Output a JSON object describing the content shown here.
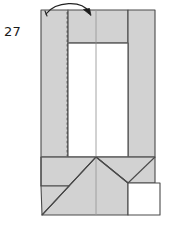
{
  "figure": {
    "step_number": "27",
    "kind": "origami-folding-diagram",
    "colors": {
      "paper_fill": "#d2d2d2",
      "paper_fill_light": "#dcdcdc",
      "back_fill": "#ffffff",
      "outline": "#4a4a4a",
      "crease_solid": "#8a8a8a",
      "crease_dashed": "#555555",
      "arrow": "#222222",
      "label_text": "#1a1a1a",
      "page_background": "#ffffff"
    },
    "geometry": {
      "body_left_x": 41,
      "body_right_x": 155,
      "body_top_y": 10,
      "body_bottom_y": 215,
      "white_window_left_x": 68,
      "white_window_right_x": 128,
      "white_window_top_y": 43,
      "center_crease_x": 96,
      "dashed_crease_x": 68,
      "lower_fold_y": 157,
      "left_notch_y": 186,
      "right_notch_y": 183,
      "white_tab_left_x": 128,
      "white_tab_right_x": 160,
      "white_tab_top_y": 183,
      "white_tab_bottom_y": 215
    },
    "arrow": {
      "label": "fold-over-arrow",
      "description": "curved arrow sweeping from upper-left edge rightward, head pointing down-right",
      "start_x": 46,
      "start_y": 13,
      "control1_x": 58,
      "control1_y": 2,
      "control2_x": 84,
      "control2_y": 2,
      "tip_x": 90,
      "tip_y": 14
    }
  }
}
